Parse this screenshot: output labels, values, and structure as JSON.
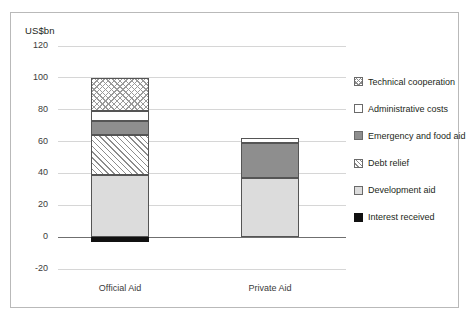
{
  "chart_data": {
    "type": "bar",
    "subtype": "stacked-bar",
    "title": "",
    "subtitle": "",
    "xlabel": "",
    "ylabel": "US$bn",
    "axis_title": "US$bn",
    "categories": [
      "Official Aid",
      "Private Aid"
    ],
    "ylim": [
      -20,
      120
    ],
    "yticks": [
      120,
      100,
      80,
      60,
      40,
      20,
      0,
      -20
    ],
    "ytick_labels": [
      "120",
      "100",
      "80",
      "60",
      "40",
      "20",
      "0",
      "-20"
    ],
    "grid": true,
    "legend_position": "right",
    "series": [
      {
        "name": "Technical cooperation",
        "pattern": "cross-hatch",
        "color": "#ffffff",
        "values": [
          21,
          0
        ]
      },
      {
        "name": "Administrative costs",
        "pattern": "solid-white",
        "color": "#ffffff",
        "values": [
          6,
          3
        ]
      },
      {
        "name": "Emergency and food aid",
        "pattern": "solid-dark-gray",
        "color": "#8e8e8e",
        "values": [
          9,
          22
        ]
      },
      {
        "name": "Debt relief",
        "pattern": "diagonal-hatch",
        "color": "#ffffff",
        "values": [
          25,
          0
        ]
      },
      {
        "name": "Development aid",
        "pattern": "solid-light-gray",
        "color": "#dcdcdc",
        "values": [
          39,
          37
        ]
      },
      {
        "name": "Interest received",
        "pattern": "solid-black",
        "color": "#111111",
        "values": [
          -3,
          0
        ]
      }
    ],
    "totals": [
      100,
      62
    ]
  },
  "legend": {
    "items": [
      {
        "label": "Technical cooperation",
        "swatch": "tech-swatch"
      },
      {
        "label": "Administrative costs",
        "swatch": "admin-swatch"
      },
      {
        "label": "Emergency and food aid",
        "swatch": "emergency-swatch"
      },
      {
        "label": "Debt relief",
        "swatch": "debt-swatch"
      },
      {
        "label": "Development aid",
        "swatch": "development-swatch"
      },
      {
        "label": "Interest received",
        "swatch": "interest-swatch"
      }
    ]
  }
}
